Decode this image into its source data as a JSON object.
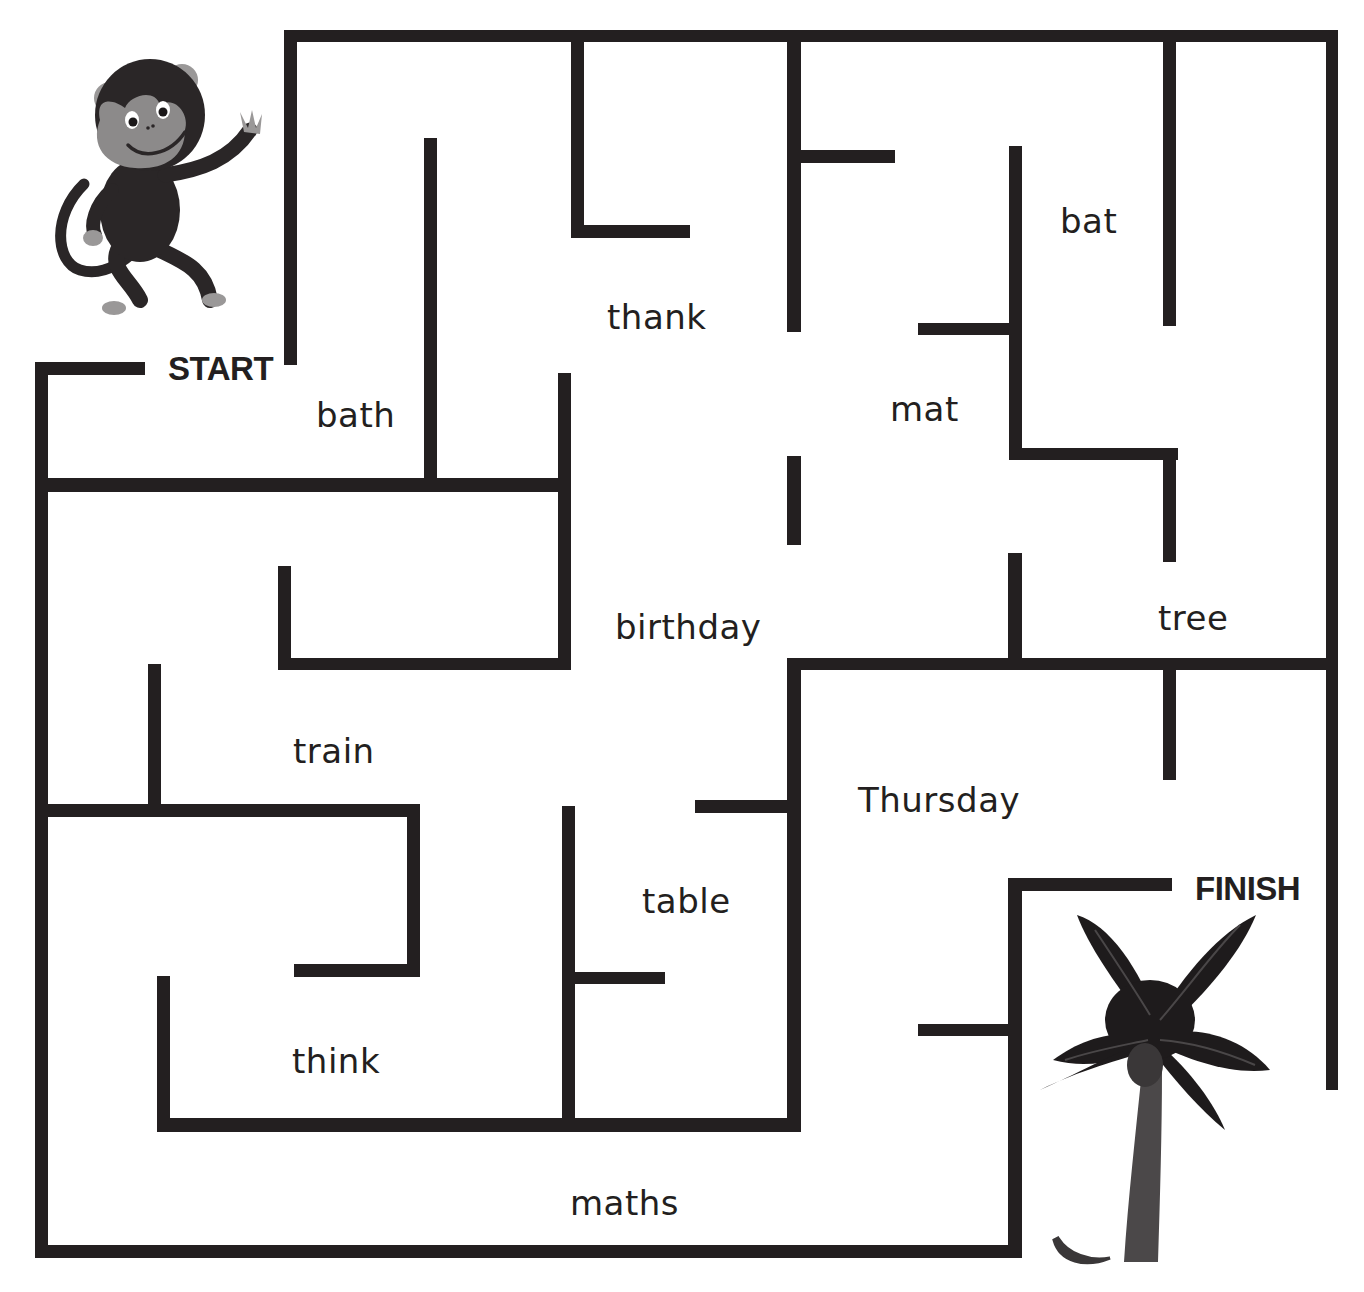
{
  "colors": {
    "wall": "#231f20",
    "background": "#ffffff",
    "monkey_body": "#2a2627",
    "monkey_face": "#8c8a8a",
    "monkey_ears": "#9a9898",
    "tree_leaves": "#1e1b1c",
    "tree_veins": "#4a4748",
    "tree_trunk": "#4b4849",
    "banana": "#3a3738"
  },
  "start": {
    "label": "START",
    "x": 168,
    "y": 352
  },
  "finish": {
    "label": "FINISH",
    "x": 1195,
    "y": 872
  },
  "words": [
    {
      "text": "bath",
      "x": 316,
      "y": 398
    },
    {
      "text": "thank",
      "x": 607,
      "y": 300
    },
    {
      "text": "bat",
      "x": 1060,
      "y": 204
    },
    {
      "text": "mat",
      "x": 890,
      "y": 392
    },
    {
      "text": "birthday",
      "x": 615,
      "y": 610
    },
    {
      "text": "tree",
      "x": 1158,
      "y": 601
    },
    {
      "text": "train",
      "x": 293,
      "y": 734
    },
    {
      "text": "Thursday",
      "x": 858,
      "y": 783
    },
    {
      "text": "table",
      "x": 642,
      "y": 884
    },
    {
      "text": "think",
      "x": 292,
      "y": 1044
    },
    {
      "text": "maths",
      "x": 570,
      "y": 1186
    }
  ],
  "walls": [
    [
      284,
      30,
      1338,
      42
    ],
    [
      1326,
      30,
      1338,
      1090
    ],
    [
      284,
      30,
      297,
      365
    ],
    [
      35,
      362,
      145,
      375
    ],
    [
      35,
      362,
      48,
      1258
    ],
    [
      35,
      1245,
      1022,
      1258
    ],
    [
      1008,
      878,
      1022,
      1258
    ],
    [
      1008,
      878,
      1172,
      891
    ],
    [
      35,
      478,
      570,
      492
    ],
    [
      424,
      138,
      437,
      485
    ],
    [
      558,
      373,
      571,
      670
    ],
    [
      278,
      658,
      571,
      670
    ],
    [
      278,
      566,
      291,
      670
    ],
    [
      571,
      40,
      584,
      238
    ],
    [
      571,
      225,
      690,
      238
    ],
    [
      787,
      40,
      801,
      332
    ],
    [
      787,
      150,
      895,
      163
    ],
    [
      1009,
      146,
      1022,
      460
    ],
    [
      918,
      323,
      1022,
      335
    ],
    [
      1009,
      448,
      1178,
      460
    ],
    [
      1163,
      448,
      1176,
      562
    ],
    [
      1163,
      40,
      1176,
      326
    ],
    [
      787,
      456,
      801,
      545
    ],
    [
      1008,
      553,
      1022,
      667
    ],
    [
      787,
      658,
      1338,
      670
    ],
    [
      787,
      658,
      801,
      1132
    ],
    [
      695,
      800,
      794,
      813
    ],
    [
      1163,
      665,
      1176,
      780
    ],
    [
      918,
      1024,
      1022,
      1036
    ],
    [
      148,
      664,
      161,
      808
    ],
    [
      35,
      804,
      420,
      817
    ],
    [
      407,
      804,
      420,
      977
    ],
    [
      294,
      964,
      420,
      977
    ],
    [
      157,
      976,
      170,
      1131
    ],
    [
      157,
      1118,
      794,
      1132
    ],
    [
      562,
      806,
      575,
      1125
    ],
    [
      570,
      972,
      665,
      984
    ]
  ]
}
